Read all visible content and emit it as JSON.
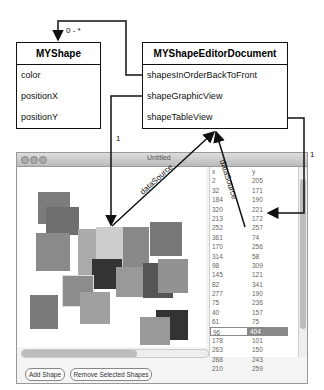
{
  "diagram": {
    "classes": [
      {
        "name": "MYShape",
        "attributes": [
          "color",
          "positionX",
          "positionY"
        ]
      },
      {
        "name": "MYShapeEditorDocument",
        "attributes": [
          "shapesInOrderBackToFront",
          "shapeGraphicView",
          "shapeTableView"
        ]
      }
    ],
    "labels": {
      "multiplicity_many": "0 - *",
      "multiplicity_one_left": "1",
      "multiplicity_one_right": "1",
      "datasource_left": "dataSource",
      "datasource_right": "dataSource"
    }
  },
  "window": {
    "title": "Untitled",
    "buttons": {
      "add": "Add Shape",
      "remove": "Remove Selected Shapes"
    },
    "table": {
      "header": [
        "x",
        "y"
      ],
      "rows": [
        [
          "2",
          "205"
        ],
        [
          "32",
          "171"
        ],
        [
          "184",
          "190"
        ],
        [
          "320",
          "221"
        ],
        [
          "213",
          "172"
        ],
        [
          "252",
          "257"
        ],
        [
          "361",
          "74"
        ],
        [
          "170",
          "256"
        ],
        [
          "314",
          "58"
        ],
        [
          "98",
          "309"
        ],
        [
          "145",
          "121"
        ],
        [
          "82",
          "341"
        ],
        [
          "277",
          "190"
        ],
        [
          "75",
          "236"
        ],
        [
          "40",
          "157"
        ],
        [
          "61",
          "75"
        ],
        [
          "96",
          "404"
        ],
        [
          "178",
          "101"
        ],
        [
          "263",
          "150"
        ],
        [
          "288",
          "243"
        ],
        [
          "210",
          "259"
        ]
      ],
      "selected_index": 16
    }
  }
}
